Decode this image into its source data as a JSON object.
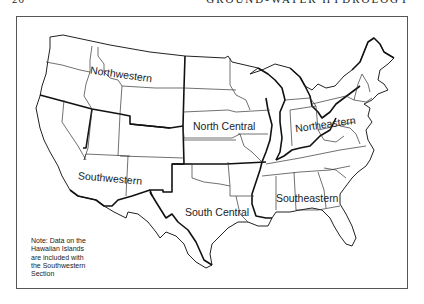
{
  "header": {
    "page_number": "20",
    "running_title": "GROUND-WATER HYDROLOGY"
  },
  "map": {
    "regions": [
      {
        "id": "northwestern",
        "label": "Northwestern"
      },
      {
        "id": "north_central",
        "label": "North Central"
      },
      {
        "id": "northeastern",
        "label": "Northeastern"
      },
      {
        "id": "southwestern",
        "label": "Southwestern"
      },
      {
        "id": "south_central",
        "label": "South Central"
      },
      {
        "id": "southeastern",
        "label": "Southeastern"
      }
    ],
    "note": {
      "lines": [
        "Note: Data on the",
        "Hawaiian Islands",
        "are included with",
        "the Southwestern",
        "Section"
      ]
    },
    "colors": {
      "background": "#ffffff",
      "lines": "#222222"
    }
  }
}
